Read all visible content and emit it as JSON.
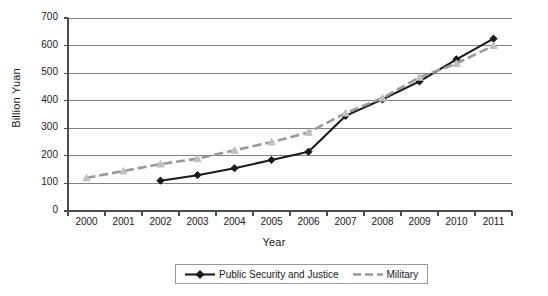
{
  "chart_data": {
    "type": "line",
    "title": "",
    "xlabel": "Year",
    "ylabel": "Billion Yuan",
    "categories": [
      "2000",
      "2001",
      "2002",
      "2003",
      "2004",
      "2005",
      "2006",
      "2007",
      "2008",
      "2009",
      "2010",
      "2011"
    ],
    "ylim": [
      0,
      700
    ],
    "ytick_step": 100,
    "yticks": [
      "0",
      "100",
      "200",
      "300",
      "400",
      "500",
      "600",
      "700"
    ],
    "grid": "horizontal",
    "legend_position": "bottom",
    "series": [
      {
        "name": "Public Security and Justice",
        "color": "#1a1a1a",
        "style": "solid",
        "marker": "diamond",
        "values": [
          null,
          null,
          110,
          130,
          155,
          185,
          215,
          345,
          405,
          470,
          550,
          625
        ]
      },
      {
        "name": "Military",
        "color": "#9a9a9a",
        "style": "dashed",
        "marker": "triangle",
        "values": [
          120,
          145,
          170,
          190,
          220,
          250,
          285,
          355,
          410,
          485,
          535,
          600
        ]
      }
    ]
  },
  "axes": {
    "y_title": "Billion Yuan",
    "x_title": "Year"
  },
  "legend": {
    "items": [
      {
        "label": "Public Security and Justice"
      },
      {
        "label": "Military"
      }
    ]
  }
}
